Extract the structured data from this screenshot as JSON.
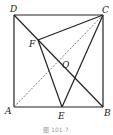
{
  "figure": {
    "caption": "图 101-7",
    "points": {
      "A": {
        "label": "A",
        "x": 14,
        "y": 107
      },
      "B": {
        "label": "B",
        "x": 103,
        "y": 107
      },
      "C": {
        "label": "C",
        "x": 103,
        "y": 15
      },
      "D": {
        "label": "D",
        "x": 14,
        "y": 15
      },
      "E": {
        "label": "E",
        "x": 62,
        "y": 107
      },
      "F": {
        "label": "F",
        "x": 38,
        "y": 40
      },
      "O": {
        "label": "O",
        "x": 59,
        "y": 61
      }
    },
    "segments": [
      {
        "from": "A",
        "to": "B",
        "style": "solid"
      },
      {
        "from": "B",
        "to": "C",
        "style": "solid"
      },
      {
        "from": "C",
        "to": "D",
        "style": "solid"
      },
      {
        "from": "D",
        "to": "A",
        "style": "solid"
      },
      {
        "from": "D",
        "to": "B",
        "style": "solid"
      },
      {
        "from": "A",
        "to": "C",
        "style": "dashed"
      },
      {
        "from": "C",
        "to": "F",
        "style": "solid"
      },
      {
        "from": "F",
        "to": "E",
        "style": "solid"
      },
      {
        "from": "C",
        "to": "E",
        "style": "solid"
      }
    ]
  }
}
